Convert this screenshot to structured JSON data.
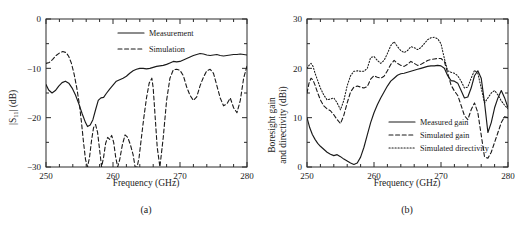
{
  "figure": {
    "panels": [
      {
        "caption": "(a)",
        "xlabel": "Frequency (GHz)",
        "ylabel": "|S11| (dB)",
        "ylabel_main": "|S",
        "ylabel_sub": "11",
        "ylabel_tail": "| (dB)",
        "xticks": [
          "250",
          "260",
          "270",
          "280"
        ],
        "yticks": [
          "0",
          "-10",
          "-20",
          "-30"
        ],
        "legend": [
          {
            "label": "Measurement",
            "style": "solid"
          },
          {
            "label": "Simulation",
            "style": "dashed"
          }
        ]
      },
      {
        "caption": "(b)",
        "xlabel": "Frequency (GHz)",
        "ylabel_line1": "Boresight gain",
        "ylabel_line2": "and directivity (dBi)",
        "xticks": [
          "250",
          "260",
          "270",
          "280"
        ],
        "yticks": [
          "30",
          "20",
          "10",
          "0"
        ],
        "legend": [
          {
            "label": "Measured gain",
            "style": "solid"
          },
          {
            "label": "Simulated gain",
            "style": "dashed"
          },
          {
            "label": "Simulated directivity",
            "style": "dotted"
          }
        ]
      }
    ]
  },
  "chart_data": [
    {
      "type": "line",
      "title": "",
      "panel": "(a)",
      "xlabel": "Frequency (GHz)",
      "ylabel": "|S11| (dB)",
      "xlim": [
        250,
        280
      ],
      "ylim": [
        -30,
        0
      ],
      "xticks": [
        250,
        260,
        270,
        280
      ],
      "yticks": [
        -30,
        -20,
        -10,
        0
      ],
      "grid": false,
      "legend_position": "top-center",
      "series": [
        {
          "name": "Measurement",
          "style": "solid",
          "x": [
            250.0,
            250.4,
            250.9,
            251.4,
            251.9,
            252.4,
            252.9,
            253.4,
            253.9,
            254.4,
            254.9,
            255.4,
            255.9,
            256.2,
            256.6,
            257.0,
            257.4,
            257.8,
            258.2,
            258.6,
            259.0,
            259.5,
            260.0,
            260.5,
            261.0,
            261.5,
            262.0,
            262.5,
            263.0,
            263.5,
            264.0,
            264.5,
            265.0,
            265.5,
            266.0,
            266.5,
            267.0,
            267.5,
            268.0,
            268.5,
            269.0,
            269.5,
            270.0,
            270.5,
            271.0,
            271.5,
            272.0,
            272.5,
            273.0,
            273.5,
            274.0,
            274.5,
            275.0,
            275.5,
            276.0,
            276.5,
            277.0,
            277.5,
            278.0,
            278.5,
            279.0,
            279.5,
            280.0
          ],
          "y": [
            -13.3,
            -14.4,
            -15.0,
            -14.5,
            -13.6,
            -12.9,
            -12.6,
            -13.0,
            -14.0,
            -15.4,
            -17.2,
            -19.2,
            -21.0,
            -21.8,
            -21.5,
            -20.4,
            -18.4,
            -16.5,
            -16.0,
            -15.9,
            -15.1,
            -14.2,
            -13.4,
            -12.6,
            -12.3,
            -12.0,
            -11.6,
            -11.0,
            -10.5,
            -10.2,
            -10.0,
            -10.0,
            -10.1,
            -10.0,
            -9.8,
            -9.6,
            -9.5,
            -9.4,
            -9.2,
            -8.9,
            -8.6,
            -8.7,
            -8.6,
            -8.3,
            -8.0,
            -7.7,
            -7.4,
            -7.2,
            -7.0,
            -7.1,
            -7.3,
            -7.4,
            -7.3,
            -7.2,
            -7.4,
            -7.5,
            -7.4,
            -7.3,
            -7.2,
            -7.2,
            -7.1,
            -7.2,
            -7.3
          ]
        },
        {
          "name": "Simulation",
          "style": "dashed",
          "x": [
            250.0,
            250.5,
            251.0,
            251.5,
            252.0,
            252.5,
            253.0,
            253.4,
            253.8,
            254.2,
            254.6,
            255.0,
            255.3,
            255.6,
            255.9,
            256.2,
            256.5,
            256.8,
            257.1,
            257.4,
            257.7,
            258.0,
            258.3,
            258.6,
            258.9,
            259.2,
            259.5,
            259.8,
            260.1,
            260.4,
            260.7,
            261.0,
            261.4,
            261.8,
            262.2,
            262.6,
            263.0,
            263.3,
            263.6,
            263.9,
            264.2,
            264.6,
            265.0,
            265.4,
            265.8,
            266.0,
            266.3,
            266.6,
            267.0,
            267.5,
            268.0,
            268.5,
            269.0,
            269.5,
            270.0,
            270.5,
            271.0,
            271.5,
            272.0,
            272.5,
            273.0,
            273.5,
            274.0,
            274.5,
            275.0,
            275.5,
            276.0,
            276.5,
            277.0,
            277.5,
            278.0,
            278.5,
            279.0,
            279.5,
            280.0
          ],
          "y": [
            -9.0,
            -8.8,
            -8.2,
            -7.4,
            -6.9,
            -6.6,
            -6.8,
            -7.6,
            -9.0,
            -11.2,
            -14.0,
            -17.5,
            -21.0,
            -25.0,
            -28.5,
            -30.0,
            -28.0,
            -24.6,
            -22.0,
            -21.4,
            -23.0,
            -26.5,
            -30.0,
            -28.0,
            -25.2,
            -24.0,
            -24.4,
            -23.6,
            -25.0,
            -28.0,
            -30.0,
            -28.5,
            -25.5,
            -23.5,
            -24.0,
            -25.5,
            -27.5,
            -30.0,
            -30.0,
            -28.0,
            -24.5,
            -20.0,
            -16.0,
            -13.0,
            -12.0,
            -14.0,
            -20.0,
            -26.0,
            -30.0,
            -24.0,
            -16.5,
            -12.0,
            -10.3,
            -10.2,
            -10.4,
            -11.5,
            -13.8,
            -15.5,
            -16.5,
            -15.8,
            -13.5,
            -11.8,
            -10.5,
            -10.2,
            -11.0,
            -13.5,
            -16.0,
            -17.6,
            -17.2,
            -16.0,
            -18.0,
            -19.0,
            -16.5,
            -12.0,
            -9.5
          ]
        }
      ]
    },
    {
      "type": "line",
      "title": "",
      "panel": "(b)",
      "xlabel": "Frequency (GHz)",
      "ylabel": "Boresight gain and directivity (dBi)",
      "xlim": [
        250,
        280
      ],
      "ylim": [
        0,
        30
      ],
      "xticks": [
        250,
        260,
        270,
        280
      ],
      "yticks": [
        0,
        10,
        20,
        30
      ],
      "grid": false,
      "legend_position": "bottom-center",
      "series": [
        {
          "name": "Measured gain",
          "style": "solid",
          "x": [
            250.0,
            250.4,
            250.8,
            251.2,
            251.6,
            252.0,
            252.5,
            253.0,
            253.5,
            254.0,
            254.5,
            255.0,
            255.5,
            256.0,
            256.5,
            257.0,
            257.5,
            258.0,
            258.5,
            259.0,
            259.5,
            260.0,
            260.5,
            261.0,
            261.5,
            262.0,
            262.5,
            263.0,
            263.5,
            264.0,
            264.5,
            265.0,
            265.5,
            266.0,
            266.5,
            267.0,
            267.5,
            268.0,
            268.5,
            269.0,
            269.5,
            270.0,
            270.5,
            271.0,
            271.5,
            272.0,
            272.5,
            273.0,
            273.5,
            274.0,
            274.5,
            275.0,
            275.5,
            276.0,
            276.5,
            277.0,
            277.5,
            278.0,
            278.5,
            279.0,
            279.5,
            280.0
          ],
          "y": [
            10.0,
            8.0,
            6.6,
            5.6,
            4.8,
            4.2,
            3.6,
            3.0,
            2.6,
            2.3,
            2.5,
            2.1,
            1.6,
            1.2,
            0.8,
            0.5,
            0.8,
            2.0,
            4.0,
            6.5,
            9.0,
            11.0,
            12.6,
            14.0,
            15.2,
            16.4,
            17.4,
            18.0,
            18.6,
            18.9,
            19.0,
            19.2,
            19.4,
            19.6,
            19.8,
            20.0,
            20.2,
            20.4,
            20.5,
            20.5,
            20.6,
            20.5,
            20.0,
            18.5,
            17.5,
            17.4,
            17.0,
            15.5,
            14.0,
            14.2,
            16.0,
            18.5,
            19.5,
            18.0,
            13.0,
            7.0,
            9.0,
            12.0,
            14.0,
            15.5,
            14.0,
            12.0
          ]
        },
        {
          "name": "Simulated gain",
          "style": "dashed",
          "x": [
            250.0,
            250.3,
            250.6,
            250.9,
            251.2,
            251.6,
            252.0,
            252.5,
            253.0,
            253.5,
            254.0,
            254.5,
            255.0,
            255.5,
            256.0,
            256.5,
            257.0,
            257.5,
            258.0,
            258.5,
            259.0,
            259.5,
            260.0,
            260.5,
            261.0,
            261.5,
            262.0,
            262.5,
            263.0,
            263.5,
            264.0,
            264.5,
            265.0,
            265.5,
            266.0,
            266.5,
            267.0,
            267.5,
            268.0,
            268.5,
            269.0,
            269.5,
            270.0,
            270.5,
            271.0,
            271.5,
            272.0,
            272.5,
            273.0,
            273.5,
            274.0,
            274.5,
            275.0,
            275.5,
            276.0,
            276.5,
            277.0,
            277.5,
            278.0,
            278.5,
            279.0,
            279.5,
            280.0
          ],
          "y": [
            15.0,
            17.0,
            18.0,
            17.6,
            16.6,
            15.0,
            13.6,
            12.4,
            11.8,
            11.4,
            10.6,
            9.6,
            8.8,
            10.5,
            13.0,
            15.2,
            16.2,
            16.4,
            16.2,
            16.0,
            16.3,
            17.8,
            18.5,
            18.2,
            18.0,
            18.4,
            19.5,
            20.8,
            21.6,
            21.0,
            20.6,
            20.4,
            20.8,
            21.4,
            21.0,
            20.6,
            20.8,
            21.2,
            21.6,
            21.8,
            21.9,
            22.0,
            22.0,
            21.4,
            19.0,
            16.6,
            15.4,
            14.5,
            12.5,
            10.4,
            9.6,
            11.6,
            13.0,
            11.0,
            6.5,
            2.0,
            1.8,
            3.0,
            5.0,
            7.0,
            9.0,
            10.2,
            10.0
          ]
        },
        {
          "name": "Simulated directivity",
          "style": "dotted",
          "x": [
            250.0,
            250.3,
            250.6,
            250.9,
            251.2,
            251.6,
            252.0,
            252.5,
            253.0,
            253.5,
            254.0,
            254.5,
            255.0,
            255.5,
            256.0,
            256.5,
            257.0,
            257.5,
            258.0,
            258.5,
            259.0,
            259.5,
            260.0,
            260.5,
            261.0,
            261.5,
            262.0,
            262.5,
            263.0,
            263.5,
            264.0,
            264.5,
            265.0,
            265.5,
            266.0,
            266.5,
            267.0,
            267.5,
            268.0,
            268.5,
            269.0,
            269.5,
            270.0,
            270.5,
            271.0,
            271.5,
            272.0,
            272.5,
            273.0,
            273.5,
            274.0,
            274.5,
            275.0,
            275.5,
            276.0,
            276.5,
            277.0,
            277.5,
            278.0,
            278.5,
            279.0,
            279.5,
            280.0
          ],
          "y": [
            20.0,
            20.6,
            21.0,
            20.4,
            19.0,
            17.5,
            16.0,
            14.6,
            13.6,
            13.8,
            14.0,
            13.0,
            11.6,
            13.5,
            16.5,
            18.5,
            19.4,
            19.5,
            19.4,
            19.4,
            20.0,
            22.2,
            22.4,
            21.6,
            21.0,
            21.6,
            23.0,
            24.6,
            25.4,
            24.4,
            23.6,
            23.2,
            23.6,
            24.4,
            24.2,
            23.8,
            24.2,
            25.0,
            25.8,
            26.2,
            26.3,
            26.0,
            25.0,
            22.0,
            19.5,
            19.2,
            19.0,
            18.5,
            17.4,
            16.0,
            16.2,
            18.0,
            19.6,
            19.0,
            16.0,
            13.0,
            14.0,
            15.0,
            15.5,
            14.6,
            13.4,
            12.5,
            11.8
          ]
        }
      ]
    }
  ]
}
